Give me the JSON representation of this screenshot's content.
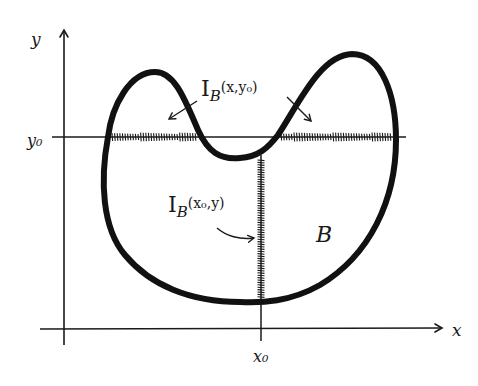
{
  "diagram": {
    "style": "hand-drawn sketch",
    "colors": {
      "ink": "#1a1a1a",
      "background": "#ffffff"
    },
    "axes": {
      "x_label": "x",
      "y_label": "y",
      "x0_label": "x₀",
      "y0_label": "y₀"
    },
    "region": {
      "label": "B",
      "description": "closed bean/kidney-shaped region with two upper lobes and a dip between them"
    },
    "annotations": {
      "horizontal_section": {
        "prefix": "I",
        "subscript": "B",
        "args": "(x,y₀)",
        "description": "horizontal slice of B at y = y₀, hatched where inside B (two segments)"
      },
      "vertical_section": {
        "prefix": "I",
        "subscript": "B",
        "args": "(x₀,y)",
        "description": "vertical slice of B at x = x₀, hatched where inside B"
      }
    }
  }
}
